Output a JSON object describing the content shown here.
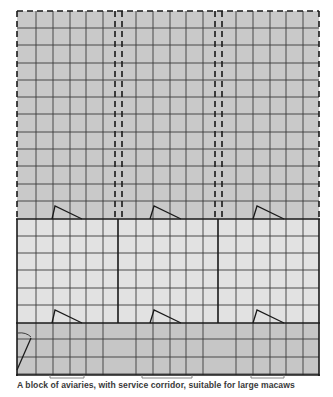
{
  "caption": "A block of aviaries, with service corridor, suitable for large macaws",
  "colors": {
    "flight_fill": "#c9c9c9",
    "shelter_fill": "#e2e2e2",
    "corridor_fill": "#c6c6c6",
    "line": "#1a1a1a",
    "grid": "#3a3a3a"
  },
  "diagram": {
    "sections": [
      {
        "name": "outdoor-flights",
        "style": "dashed",
        "count": 3
      },
      {
        "name": "indoor-shelters",
        "style": "solid",
        "count": 3
      },
      {
        "name": "service-corridor",
        "style": "solid",
        "count": 1
      }
    ],
    "doors": 7
  }
}
